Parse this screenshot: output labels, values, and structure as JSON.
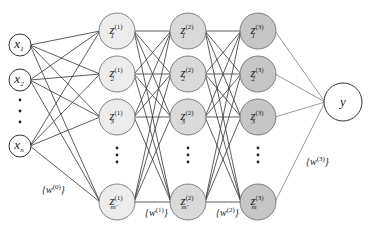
{
  "diagram": {
    "type": "feedforward-neural-network",
    "colors": {
      "input_fill": "#ffffff",
      "layer1_fill": "#ececec",
      "layer2_fill": "#d9d9d9",
      "layer3_fill": "#c6c6c6",
      "output_fill": "#ffffff",
      "stroke": "#444444",
      "edge": "#333333"
    },
    "input_layer": {
      "nodes": [
        {
          "base": "x",
          "sub": "1",
          "x": 20,
          "y": 45
        },
        {
          "base": "x",
          "sub": "2",
          "x": 20,
          "y": 80
        },
        {
          "base": "x",
          "sub": "n",
          "x": 20,
          "y": 146
        }
      ],
      "ellipsis_dots": [
        {
          "x": 20,
          "y": 100
        },
        {
          "x": 20,
          "y": 111
        },
        {
          "x": 20,
          "y": 122
        }
      ]
    },
    "hidden_layers": [
      {
        "index": "1",
        "x": 117,
        "nodes": [
          {
            "base": "z",
            "sub": "1",
            "sup": "(1)",
            "y": 31
          },
          {
            "base": "z",
            "sub": "2",
            "sup": "(1)",
            "y": 74
          },
          {
            "base": "z",
            "sub": "3",
            "sup": "(1)",
            "y": 117
          },
          {
            "base": "z",
            "sub": "m'",
            "sup": "(1)",
            "y": 202
          }
        ],
        "ellipsis_dots": [
          148,
          155,
          162
        ]
      },
      {
        "index": "2",
        "x": 188,
        "nodes": [
          {
            "base": "z",
            "sub": "1",
            "sup": "(2)",
            "y": 31
          },
          {
            "base": "z",
            "sub": "2",
            "sup": "(2)",
            "y": 74
          },
          {
            "base": "z",
            "sub": "3",
            "sup": "(2)",
            "y": 117
          },
          {
            "base": "z",
            "sub": "m'",
            "sup": "(2)",
            "y": 202
          }
        ],
        "ellipsis_dots": [
          148,
          155,
          162
        ]
      },
      {
        "index": "3",
        "x": 258,
        "nodes": [
          {
            "base": "z",
            "sub": "1",
            "sup": "(3)",
            "y": 31
          },
          {
            "base": "z",
            "sub": "2",
            "sup": "(3)",
            "y": 74
          },
          {
            "base": "z",
            "sub": "3",
            "sup": "(3)",
            "y": 117
          },
          {
            "base": "z",
            "sub": "m",
            "sup": "(3)",
            "y": 202
          }
        ],
        "ellipsis_dots": [
          148,
          155,
          162
        ]
      }
    ],
    "output_node": {
      "label": "y",
      "x": 343,
      "y": 102
    },
    "weight_labels": [
      {
        "text": "{w",
        "sup": "(0)",
        "close": "}",
        "x": 42,
        "y": 193
      },
      {
        "text": "{w",
        "sup": "(1)",
        "close": "}",
        "x": 145,
        "y": 216
      },
      {
        "text": "{w",
        "sup": "(2)",
        "close": "}",
        "x": 216,
        "y": 216
      },
      {
        "text": "{w",
        "sup": "(3)",
        "close": "}",
        "x": 306,
        "y": 165
      }
    ]
  }
}
